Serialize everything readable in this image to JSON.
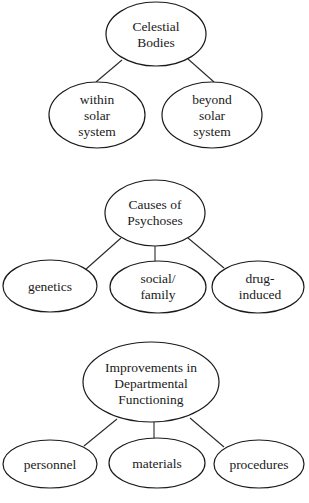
{
  "diagrams": [
    {
      "root": {
        "lines": [
          "Celestial",
          "Bodies"
        ]
      },
      "children": [
        {
          "lines": [
            "within",
            "solar",
            "system"
          ]
        },
        {
          "lines": [
            "beyond",
            "solar",
            "system"
          ]
        }
      ]
    },
    {
      "root": {
        "lines": [
          "Causes of",
          "Psychoses"
        ]
      },
      "children": [
        {
          "lines": [
            "genetics"
          ]
        },
        {
          "lines": [
            "social/",
            "family"
          ]
        },
        {
          "lines": [
            "drug-",
            "induced"
          ]
        }
      ]
    },
    {
      "root": {
        "lines": [
          "Improvements in",
          "Departmental",
          "Functioning"
        ]
      },
      "children": [
        {
          "lines": [
            "personnel"
          ]
        },
        {
          "lines": [
            "materials"
          ]
        },
        {
          "lines": [
            "procedures"
          ]
        }
      ]
    }
  ]
}
